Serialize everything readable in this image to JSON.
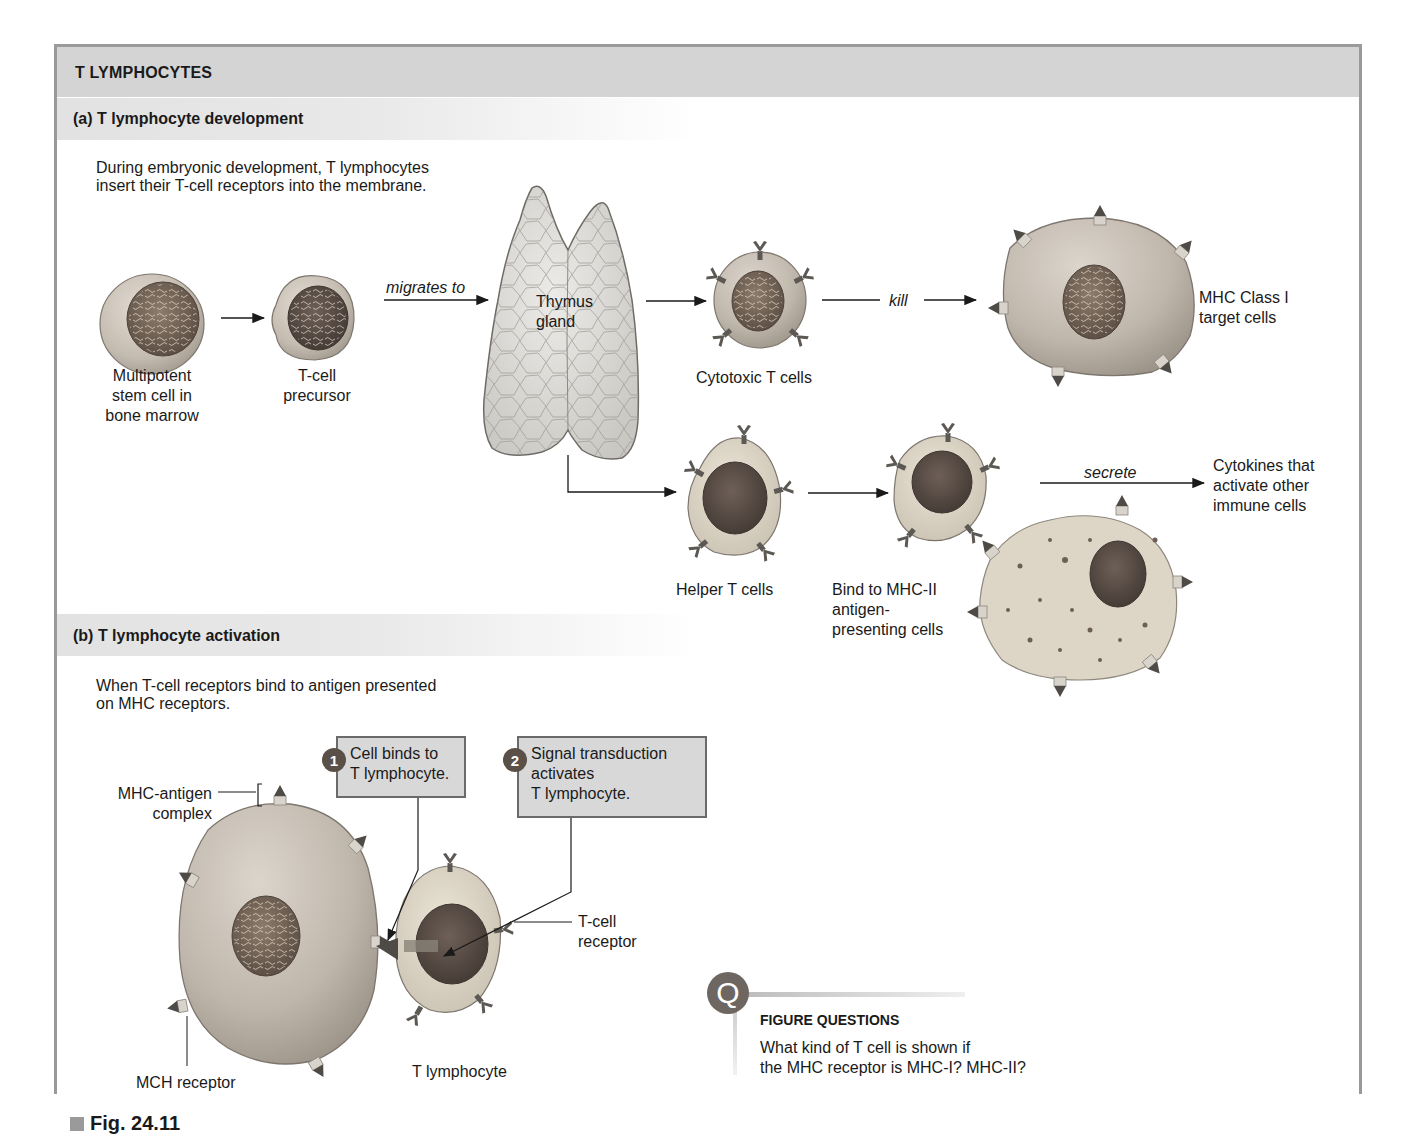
{
  "figure": {
    "title": "T LYMPHOCYTES",
    "label": "Fig. 24.11",
    "colors": {
      "title_bar": "#d4d4d4",
      "frame_border": "#9a9a9a",
      "callout_fill": "#d8d8d8",
      "badge_fill": "#5a5048",
      "cell_fill": "#c9c1b6",
      "nucleus_fill": "#7a6a5c",
      "receptor_fill": "#5c5853"
    }
  },
  "section_a": {
    "heading": "(a) T lymphocyte development",
    "intro_line1": "During embryonic development, T lymphocytes",
    "intro_line2": "insert their T-cell receptors into the membrane.",
    "stem_cell": {
      "line1": "Multipotent",
      "line2": "stem cell in",
      "line3": "bone marrow"
    },
    "precursor": {
      "line1": "T-cell",
      "line2": "precursor"
    },
    "migrates_label": "migrates to",
    "thymus": {
      "line1": "Thymus",
      "line2": "gland"
    },
    "cytotoxic_label": "Cytotoxic T cells",
    "kill_label": "kill",
    "target": {
      "line1": "MHC Class I",
      "line2": "target cells"
    },
    "helper_label": "Helper T cells",
    "bind": {
      "line1": "Bind to MHC-II",
      "line2": "antigen-",
      "line3": "presenting cells"
    },
    "secrete_label": "secrete",
    "cytokines": {
      "line1": "Cytokines that",
      "line2": "activate other",
      "line3": "immune cells"
    }
  },
  "section_b": {
    "heading": "(b) T lymphocyte activation",
    "intro_line1": "When T-cell receptors bind to antigen presented",
    "intro_line2": "on MHC receptors.",
    "step1": {
      "number": "1",
      "line1": "Cell binds to",
      "line2": "T lymphocyte."
    },
    "step2": {
      "number": "2",
      "line1": "Signal transduction",
      "line2": "activates",
      "line3": "T lymphocyte."
    },
    "mhc_antigen": {
      "line1": "MHC-antigen",
      "line2": "complex"
    },
    "tcell_receptor": {
      "line1": "T-cell",
      "line2": "receptor"
    },
    "mch_receptor_label": "MCH receptor",
    "t_lymphocyte_label": "T lymphocyte"
  },
  "figure_questions": {
    "icon": "Q",
    "heading": "FIGURE QUESTIONS",
    "line1": "What kind of T cell is shown if",
    "line2": "the MHC receptor is MHC-I?  MHC-II?"
  }
}
